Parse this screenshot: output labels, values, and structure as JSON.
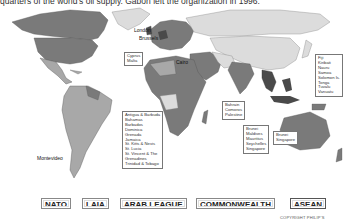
{
  "caption": "quarters of the world's oil supply. Gabon left the organization in 1996.",
  "map": {
    "city_labels": [
      "London",
      "Brussels",
      "Cairo",
      "Montevideo"
    ],
    "callouts": {
      "cyprus_malta": [
        "Cyprus",
        "Malta"
      ],
      "caribbean": [
        "Antigua & Barbuda",
        "Bahamas",
        "Barbados",
        "Dominica",
        "Grenada",
        "Jamaica",
        "St. Kitts & Nevis",
        "St. Lucia",
        "St. Vincent & The",
        "Grenadines",
        "Trinidad & Tobago"
      ],
      "gulf_africa": [
        "Bahrain",
        "Comoros",
        "Palestine"
      ],
      "indian_ocean": [
        "Brunei",
        "Maldives",
        "Mauritius",
        "Seychelles",
        "Singapore"
      ],
      "asean_small": [
        "Brunei",
        "Singapore"
      ],
      "pacific": [
        "Fiji",
        "Kiribati",
        "Nauru",
        "Samoa",
        "Solomon Is.",
        "Tonga",
        "Tuvalu",
        "Vanuatu"
      ]
    },
    "colors": {
      "ocean": "#ffffff",
      "land_light": "#dcdcdc",
      "land_mid": "#a8a8a8",
      "land_dark": "#7a7a7a",
      "land_darkest": "#4a4a4a",
      "border": "#555555"
    }
  },
  "legend": {
    "items": [
      {
        "label": "NATO"
      },
      {
        "label": "LAIA"
      },
      {
        "label": "ARAB LEAGUE"
      },
      {
        "label": "COMMONWEALTH"
      },
      {
        "label": "ASEAN"
      }
    ]
  },
  "copyright": "COPYRIGHT PHILIP'S"
}
